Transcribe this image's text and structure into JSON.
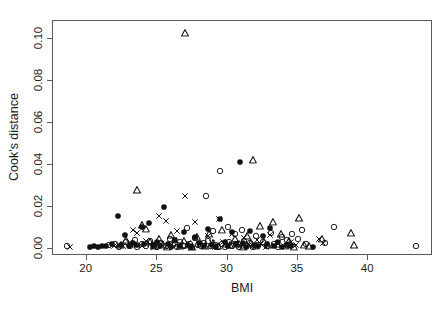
{
  "chart_data": {
    "type": "scatter",
    "title": "",
    "xlabel": "BMI",
    "ylabel": "Cook's distance",
    "xlim": [
      17.6,
      44.6
    ],
    "ylim": [
      -0.0035,
      0.1085
    ],
    "xticks": [
      20,
      25,
      30,
      35,
      40
    ],
    "xticklabels": [
      "20",
      "25",
      "30",
      "35",
      "40"
    ],
    "yticks": [
      0.0,
      0.02,
      0.04,
      0.06,
      0.08,
      0.1
    ],
    "yticklabels": [
      "0.00",
      "0.02",
      "0.04",
      "0.06",
      "0.08",
      "0.10"
    ],
    "grid": false,
    "legend": null,
    "marker_types": [
      "open-circle",
      "filled-circle",
      "open-triangle",
      "cross-x"
    ],
    "series": [
      {
        "name": "open-circle",
        "marker": "open-circle",
        "points": [
          [
            18.6,
            0.0012
          ],
          [
            21.6,
            0.0016
          ],
          [
            22.0,
            0.0022
          ],
          [
            22.3,
            0.0008
          ],
          [
            22.8,
            0.003
          ],
          [
            23.1,
            0.0014
          ],
          [
            23.4,
            0.004
          ],
          [
            23.6,
            0.0009
          ],
          [
            23.9,
            0.0021
          ],
          [
            24.2,
            0.0011
          ],
          [
            24.5,
            0.0035
          ],
          [
            24.8,
            0.0016
          ],
          [
            25.0,
            0.0007
          ],
          [
            25.3,
            0.0026
          ],
          [
            25.6,
            0.0012
          ],
          [
            25.9,
            0.0045
          ],
          [
            26.1,
            0.0019
          ],
          [
            26.4,
            0.0009
          ],
          [
            26.6,
            0.0031
          ],
          [
            26.9,
            0.0014
          ],
          [
            27.1,
            0.01
          ],
          [
            27.3,
            0.0023
          ],
          [
            27.5,
            0.0008
          ],
          [
            27.7,
            0.0052
          ],
          [
            27.9,
            0.0017
          ],
          [
            28.1,
            0.0011
          ],
          [
            28.3,
            0.0027
          ],
          [
            28.5,
            0.025
          ],
          [
            28.6,
            0.0036
          ],
          [
            28.8,
            0.0013
          ],
          [
            29.0,
            0.0085
          ],
          [
            29.1,
            0.0019
          ],
          [
            29.3,
            0.0006
          ],
          [
            29.5,
            0.037
          ],
          [
            29.6,
            0.0024
          ],
          [
            29.8,
            0.001
          ],
          [
            30.0,
            0.0105
          ],
          [
            30.1,
            0.003
          ],
          [
            30.3,
            0.0015
          ],
          [
            30.5,
            0.0069
          ],
          [
            30.6,
            0.0021
          ],
          [
            30.8,
            0.0008
          ],
          [
            31.0,
            0.009
          ],
          [
            31.2,
            0.0038
          ],
          [
            31.4,
            0.0013
          ],
          [
            31.6,
            0.0026
          ],
          [
            31.8,
            0.0009
          ],
          [
            32.0,
            0.006
          ],
          [
            32.2,
            0.0018
          ],
          [
            32.5,
            0.0033
          ],
          [
            32.8,
            0.0011
          ],
          [
            33.1,
            0.0075
          ],
          [
            33.3,
            0.0022
          ],
          [
            33.6,
            0.0008
          ],
          [
            33.9,
            0.0055
          ],
          [
            34.2,
            0.004
          ],
          [
            34.4,
            0.0016
          ],
          [
            34.6,
            0.0068
          ],
          [
            35.0,
            0.0045
          ],
          [
            35.3,
            0.009
          ],
          [
            35.6,
            0.002
          ],
          [
            36.9,
            0.0028
          ],
          [
            37.6,
            0.0105
          ],
          [
            43.4,
            0.0015
          ]
        ]
      },
      {
        "name": "filled-circle",
        "marker": "filled-circle",
        "points": [
          [
            20.2,
            0.0009
          ],
          [
            20.5,
            0.0013
          ],
          [
            20.8,
            0.001
          ],
          [
            21.1,
            0.0015
          ],
          [
            21.4,
            0.0011
          ],
          [
            21.8,
            0.0022
          ],
          [
            22.2,
            0.0155
          ],
          [
            22.4,
            0.0018
          ],
          [
            22.7,
            0.0063
          ],
          [
            23.0,
            0.0012
          ],
          [
            23.3,
            0.0028
          ],
          [
            23.6,
            0.0016
          ],
          [
            23.9,
            0.0105
          ],
          [
            24.1,
            0.002
          ],
          [
            24.4,
            0.0124
          ],
          [
            24.7,
            0.0011
          ],
          [
            25.0,
            0.0034
          ],
          [
            25.2,
            0.0015
          ],
          [
            25.5,
            0.0199
          ],
          [
            25.8,
            0.0023
          ],
          [
            26.0,
            0.0009
          ],
          [
            26.3,
            0.0041
          ],
          [
            26.6,
            0.0014
          ],
          [
            26.9,
            0.0078
          ],
          [
            27.2,
            0.0019
          ],
          [
            27.4,
            0.0008
          ],
          [
            27.7,
            0.0055
          ],
          [
            28.0,
            0.0026
          ],
          [
            28.3,
            0.0012
          ],
          [
            28.6,
            0.0095
          ],
          [
            28.9,
            0.0017
          ],
          [
            29.2,
            0.001
          ],
          [
            29.5,
            0.014
          ],
          [
            29.8,
            0.003
          ],
          [
            30.0,
            0.0013
          ],
          [
            30.3,
            0.0079
          ],
          [
            30.6,
            0.0021
          ],
          [
            30.9,
            0.0413
          ],
          [
            31.1,
            0.0025
          ],
          [
            31.3,
            0.0009
          ],
          [
            31.6,
            0.0086
          ],
          [
            31.9,
            0.0016
          ],
          [
            32.2,
            0.0011
          ],
          [
            32.5,
            0.006
          ],
          [
            32.8,
            0.002
          ],
          [
            33.0,
            0.01
          ],
          [
            33.3,
            0.0014
          ],
          [
            33.6,
            0.0031
          ],
          [
            33.9,
            0.0008
          ],
          [
            34.2,
            0.0018
          ],
          [
            34.5,
            0.0012
          ],
          [
            36.1,
            0.001
          ]
        ]
      },
      {
        "name": "open-triangle",
        "marker": "open-triangle",
        "points": [
          [
            22.4,
            0.0016
          ],
          [
            22.8,
            0.0042
          ],
          [
            23.2,
            0.0023
          ],
          [
            23.6,
            0.0278
          ],
          [
            23.9,
            0.0115
          ],
          [
            24.2,
            0.0095
          ],
          [
            24.5,
            0.003
          ],
          [
            24.8,
            0.0014
          ],
          [
            25.1,
            0.0048
          ],
          [
            25.4,
            0.0019
          ],
          [
            25.7,
            0.001
          ],
          [
            26.0,
            0.0064
          ],
          [
            26.3,
            0.0025
          ],
          [
            26.6,
            0.0012
          ],
          [
            26.9,
            0.0037
          ],
          [
            27.2,
            0.0018
          ],
          [
            27.5,
            0.0008
          ],
          [
            27.8,
            0.0056
          ],
          [
            28.1,
            0.0021
          ],
          [
            28.4,
            0.0013
          ],
          [
            28.7,
            0.0072
          ],
          [
            29.0,
            0.0029
          ],
          [
            29.3,
            0.0011
          ],
          [
            29.6,
            0.009
          ],
          [
            29.9,
            0.0024
          ],
          [
            30.2,
            0.0016
          ],
          [
            30.5,
            0.0045
          ],
          [
            30.8,
            0.002
          ],
          [
            31.1,
            0.0009
          ],
          [
            31.4,
            0.0058
          ],
          [
            31.7,
            0.0026
          ],
          [
            32.0,
            0.0014
          ],
          [
            32.3,
            0.0107
          ],
          [
            32.6,
            0.0031
          ],
          [
            32.9,
            0.0017
          ],
          [
            33.2,
            0.0128
          ],
          [
            33.5,
            0.0022
          ],
          [
            33.8,
            0.0068
          ],
          [
            34.1,
            0.0015
          ],
          [
            34.4,
            0.0038
          ],
          [
            34.7,
            0.001
          ],
          [
            35.1,
            0.0145
          ],
          [
            35.4,
            0.0019
          ],
          [
            35.8,
            0.0013
          ],
          [
            36.7,
            0.0048
          ],
          [
            38.8,
            0.0076
          ],
          [
            39.0,
            0.0016
          ],
          [
            27.0,
            0.103
          ],
          [
            31.8,
            0.0423
          ]
        ]
      },
      {
        "name": "cross-x",
        "marker": "cross-x",
        "points": [
          [
            18.8,
            0.001
          ],
          [
            21.9,
            0.0014
          ],
          [
            22.3,
            0.0018
          ],
          [
            22.6,
            0.0011
          ],
          [
            23.0,
            0.0026
          ],
          [
            23.3,
            0.009
          ],
          [
            23.6,
            0.0075
          ],
          [
            23.9,
            0.0015
          ],
          [
            24.2,
            0.0035
          ],
          [
            24.5,
            0.002
          ],
          [
            24.8,
            0.0009
          ],
          [
            25.1,
            0.0155
          ],
          [
            25.3,
            0.0023
          ],
          [
            25.6,
            0.013
          ],
          [
            25.9,
            0.0012
          ],
          [
            26.2,
            0.0043
          ],
          [
            26.4,
            0.0085
          ],
          [
            26.7,
            0.0018
          ],
          [
            27.0,
            0.025
          ],
          [
            27.2,
            0.0029
          ],
          [
            27.4,
            0.001
          ],
          [
            27.7,
            0.0125
          ],
          [
            28.0,
            0.0021
          ],
          [
            28.3,
            0.0014
          ],
          [
            28.6,
            0.0061
          ],
          [
            28.9,
            0.0027
          ],
          [
            29.1,
            0.0009
          ],
          [
            29.4,
            0.014
          ],
          [
            29.7,
            0.0033
          ],
          [
            30.0,
            0.0016
          ],
          [
            30.3,
            0.007
          ],
          [
            30.6,
            0.0024
          ],
          [
            30.9,
            0.0011
          ],
          [
            31.2,
            0.0052
          ],
          [
            31.5,
            0.0019
          ],
          [
            31.8,
            0.0013
          ],
          [
            32.1,
            0.004
          ],
          [
            32.4,
            0.0022
          ],
          [
            32.7,
            0.0008
          ],
          [
            33.0,
            0.0064
          ],
          [
            33.3,
            0.0017
          ],
          [
            33.6,
            0.0028
          ],
          [
            34.0,
            0.0012
          ],
          [
            34.5,
            0.0034
          ],
          [
            34.9,
            0.0016
          ],
          [
            36.5,
            0.0046
          ],
          [
            36.8,
            0.0026
          ]
        ]
      }
    ]
  },
  "axes": {
    "x_title": "BMI",
    "y_title": "Cook's distance"
  }
}
